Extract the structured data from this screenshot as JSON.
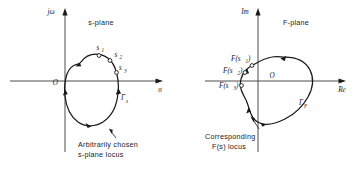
{
  "figure": {
    "background_color": "#ffffff",
    "ink_color": "#1a1a1a",
    "axis_color": "#4c4c4c"
  },
  "panels": [
    {
      "id": "s-plane",
      "title": "s-plane",
      "vertical_axis_label": "jω",
      "horizontal_axis_label": "σ",
      "origin_label": "O",
      "contour_label": "Γ",
      "contour_label_subscript": "s",
      "points": [
        {
          "label": "s",
          "subscript": "1"
        },
        {
          "label": "s",
          "subscript": "2"
        },
        {
          "label": "s",
          "subscript": "3"
        }
      ],
      "caption_lines": [
        "Arbitrarily chosen",
        "s-plane locus"
      ]
    },
    {
      "id": "F-plane",
      "title": "F-plane",
      "vertical_axis_label": "Im",
      "horizontal_axis_label": "Re",
      "origin_label": "O",
      "contour_label": "Γ",
      "contour_label_subscript": "F",
      "points": [
        {
          "label": "F(s",
          "subscript": "1",
          "label_close": ")"
        },
        {
          "label": "F(s",
          "subscript": "2",
          "label_close": ")"
        },
        {
          "label": "F(s",
          "subscript": "3",
          "label_close": ")"
        }
      ],
      "caption_lines": [
        "Corresponding",
        "F(s) locus"
      ]
    }
  ]
}
